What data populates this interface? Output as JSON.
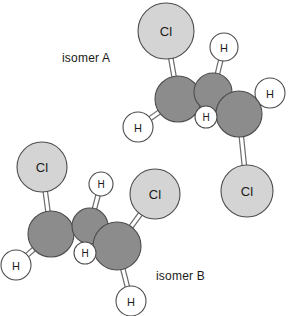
{
  "figure": {
    "background_color": "#ffffff"
  },
  "colors": {
    "carbon_fill": "#8c8c8c",
    "chlorine_fill": "#d4d4d4",
    "hydrogen_fill": "#ffffff",
    "outline": "#4d4d4d",
    "bond_stroke": "#6b6b6b",
    "text": "#1a1a1a"
  },
  "captions": [
    {
      "id": "isomer-a",
      "text": "isomer A"
    },
    {
      "id": "isomer-b",
      "text": "isomer B"
    }
  ],
  "molecules": [
    {
      "name": "isomer A",
      "caption": "isomer A",
      "atoms": [
        {
          "id": "a-cl-top",
          "element": "Cl",
          "label": "Cl",
          "type": "chlorine",
          "cx": 166,
          "cy": 31,
          "r": 28,
          "font_size": 13
        },
        {
          "id": "a-c-left",
          "element": "C",
          "label": "",
          "type": "carbon",
          "cx": 178,
          "cy": 99,
          "r": 23,
          "font_size": 0
        },
        {
          "id": "a-c-mid",
          "element": "C",
          "label": "",
          "type": "carbon",
          "cx": 213,
          "cy": 92,
          "r": 19,
          "font_size": 0
        },
        {
          "id": "a-c-right",
          "element": "C",
          "label": "",
          "type": "carbon",
          "cx": 239,
          "cy": 114,
          "r": 23,
          "font_size": 0
        },
        {
          "id": "a-h-top",
          "element": "H",
          "label": "H",
          "type": "hydrogen",
          "cx": 224,
          "cy": 47,
          "r": 14,
          "font_size": 11
        },
        {
          "id": "a-h-right",
          "element": "H",
          "label": "H",
          "type": "hydrogen",
          "cx": 270,
          "cy": 93,
          "r": 15,
          "font_size": 11
        },
        {
          "id": "a-h-left",
          "element": "H",
          "label": "H",
          "type": "hydrogen",
          "cx": 138,
          "cy": 127,
          "r": 15,
          "font_size": 11
        },
        {
          "id": "a-h-center",
          "element": "H",
          "label": "H",
          "type": "hydrogen",
          "cx": 206,
          "cy": 117,
          "r": 11,
          "font_size": 10
        },
        {
          "id": "a-cl-bottom",
          "element": "Cl",
          "label": "Cl",
          "type": "chlorine",
          "cx": 247,
          "cy": 191,
          "r": 26,
          "font_size": 13
        }
      ],
      "bonds": [
        {
          "from": "a-c-left",
          "to": "a-cl-top",
          "order": 1
        },
        {
          "from": "a-c-left",
          "to": "a-h-left",
          "order": 1
        },
        {
          "from": "a-c-left",
          "to": "a-c-mid",
          "order": 2
        },
        {
          "from": "a-c-mid",
          "to": "a-h-top",
          "order": 1
        },
        {
          "from": "a-c-mid",
          "to": "a-c-right",
          "order": 1
        },
        {
          "from": "a-c-right",
          "to": "a-h-right",
          "order": 1
        },
        {
          "from": "a-c-right",
          "to": "a-h-center",
          "order": 1
        },
        {
          "from": "a-c-right",
          "to": "a-cl-bottom",
          "order": 1
        }
      ]
    },
    {
      "name": "isomer B",
      "caption": "isomer B",
      "atoms": [
        {
          "id": "b-cl-left",
          "element": "Cl",
          "label": "Cl",
          "type": "chlorine",
          "cx": 42,
          "cy": 167,
          "r": 25,
          "font_size": 13
        },
        {
          "id": "b-cl-right",
          "element": "Cl",
          "label": "Cl",
          "type": "chlorine",
          "cx": 155,
          "cy": 194,
          "r": 25,
          "font_size": 13
        },
        {
          "id": "b-c-left",
          "element": "C",
          "label": "",
          "type": "carbon",
          "cx": 51,
          "cy": 234,
          "r": 23,
          "font_size": 0
        },
        {
          "id": "b-c-mid",
          "element": "C",
          "label": "",
          "type": "carbon",
          "cx": 90,
          "cy": 226,
          "r": 18,
          "font_size": 0
        },
        {
          "id": "b-c-right",
          "element": "C",
          "label": "",
          "type": "carbon",
          "cx": 117,
          "cy": 246,
          "r": 24,
          "font_size": 0
        },
        {
          "id": "b-h-top",
          "element": "H",
          "label": "H",
          "type": "hydrogen",
          "cx": 101,
          "cy": 184,
          "r": 12,
          "font_size": 10
        },
        {
          "id": "b-h-left",
          "element": "H",
          "label": "H",
          "type": "hydrogen",
          "cx": 16,
          "cy": 265,
          "r": 15,
          "font_size": 11
        },
        {
          "id": "b-h-center",
          "element": "H",
          "label": "H",
          "type": "hydrogen",
          "cx": 85,
          "cy": 253,
          "r": 11,
          "font_size": 10
        },
        {
          "id": "b-h-bottom",
          "element": "H",
          "label": "H",
          "type": "hydrogen",
          "cx": 131,
          "cy": 301,
          "r": 15,
          "font_size": 11
        }
      ],
      "bonds": [
        {
          "from": "b-c-left",
          "to": "b-cl-left",
          "order": 1
        },
        {
          "from": "b-c-left",
          "to": "b-h-left",
          "order": 1
        },
        {
          "from": "b-c-left",
          "to": "b-c-mid",
          "order": 2
        },
        {
          "from": "b-c-mid",
          "to": "b-h-top",
          "order": 1
        },
        {
          "from": "b-c-mid",
          "to": "b-c-right",
          "order": 1
        },
        {
          "from": "b-c-right",
          "to": "b-cl-right",
          "order": 1
        },
        {
          "from": "b-c-right",
          "to": "b-h-center",
          "order": 1
        },
        {
          "from": "b-c-right",
          "to": "b-h-bottom",
          "order": 1
        }
      ]
    }
  ],
  "draw_order": [
    "b-cl-left",
    "b-cl-right",
    "a-cl-top",
    "a-cl-bottom",
    "a-h-top",
    "a-h-right",
    "a-h-left",
    "b-h-top",
    "b-h-left",
    "b-h-bottom",
    "a-c-left",
    "a-c-mid",
    "a-c-right",
    "b-c-left",
    "b-c-mid",
    "b-c-right",
    "a-h-center",
    "b-h-center"
  ]
}
